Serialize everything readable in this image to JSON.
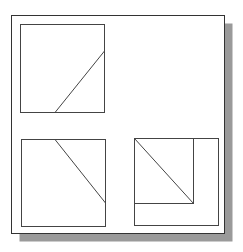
{
  "canvas": {
    "width": 243,
    "height": 252,
    "background": "#ffffff"
  },
  "colors": {
    "line": "#444444",
    "frame": "#333333",
    "shadow": "#9a9a9a",
    "paper": "#ffffff"
  },
  "frame": {
    "x": 11.5,
    "y": 15.5,
    "width": 213,
    "height": 218,
    "shadow_offset": 8
  },
  "views": [
    {
      "name": "top-left-view",
      "rects": [
        {
          "x": 20.5,
          "y": 24.5,
          "width": 84,
          "height": 88
        }
      ],
      "lines": [
        {
          "x1": 55,
          "y1": 112.5,
          "x2": 104.5,
          "y2": 51
        }
      ]
    },
    {
      "name": "bottom-left-view",
      "rects": [
        {
          "x": 21.5,
          "y": 139.5,
          "width": 84,
          "height": 87
        }
      ],
      "lines": [
        {
          "x1": 55,
          "y1": 139.5,
          "x2": 105.5,
          "y2": 203
        }
      ]
    },
    {
      "name": "bottom-right-view",
      "rects": [
        {
          "x": 134.5,
          "y": 138.5,
          "width": 84,
          "height": 87
        },
        {
          "x": 134.5,
          "y": 138.5,
          "width": 59,
          "height": 65
        }
      ],
      "lines": [
        {
          "x1": 134.5,
          "y1": 138.5,
          "x2": 193.5,
          "y2": 203.5
        }
      ]
    }
  ]
}
